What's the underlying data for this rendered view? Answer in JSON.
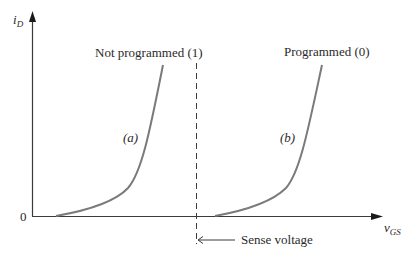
{
  "figure": {
    "y_axis_label": {
      "main": "i",
      "sub": "D"
    },
    "x_axis_label": {
      "main": "v",
      "sub": "GS"
    },
    "origin_label": "0",
    "curve_a": {
      "label": "(a)",
      "annotation": "Not programmed (1)"
    },
    "curve_b": {
      "label": "(b)",
      "annotation": "Programmed (0)"
    },
    "sense_line": {
      "label": "Sense voltage"
    },
    "colors": {
      "axis": "#3a3a3a",
      "curve": "#7a7a7a",
      "text": "#2a2a2a",
      "background": "#ffffff"
    }
  }
}
